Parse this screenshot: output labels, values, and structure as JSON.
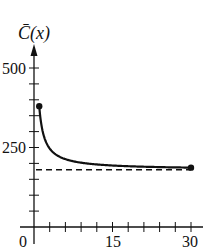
{
  "chart_data": {
    "type": "line",
    "title": "",
    "xlabel": "",
    "ylabel": "C̄(x)",
    "xlim": [
      0,
      30
    ],
    "ylim": [
      0,
      500
    ],
    "x_ticks_major": [
      0,
      15,
      30
    ],
    "x_tick_labels": [
      "0",
      "15",
      "30"
    ],
    "x_tick_step": 3,
    "y_ticks_major": [
      250,
      500
    ],
    "y_tick_labels": [
      "250",
      "500"
    ],
    "y_tick_step": 50,
    "grid": false,
    "legend": null,
    "series": [
      {
        "name": "C̄(x) = 180 + 200/x",
        "style": "solid",
        "x": [
          1,
          2,
          3,
          4,
          5,
          6,
          8,
          10,
          12,
          15,
          20,
          25,
          30
        ],
        "values": [
          380,
          280,
          246.7,
          230,
          220,
          213.3,
          205,
          200,
          196.7,
          193.3,
          190,
          188,
          186.7
        ],
        "endpoints": [
          [
            1,
            380
          ],
          [
            30,
            186.7
          ]
        ],
        "endpoint_markers": "filled-circle"
      },
      {
        "name": "horizontal asymptote",
        "style": "dashed",
        "x": [
          0,
          30
        ],
        "values": [
          180,
          180
        ]
      }
    ]
  },
  "labels": {
    "y_axis": "C̄(x)",
    "y_500": "500",
    "y_250": "250",
    "x_0": "0",
    "x_15": "15",
    "x_30": "30"
  }
}
